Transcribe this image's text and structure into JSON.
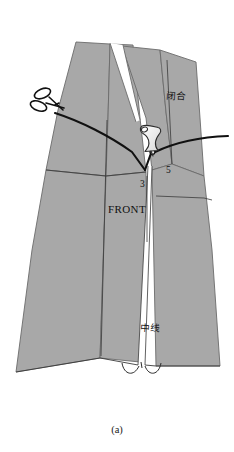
{
  "figure": {
    "caption": "(a)",
    "kind": "garment-pattern-diagram",
    "background_color": "#ffffff",
    "panel_fill": "#a8a8a8",
    "panel_stroke": "#6b6b6b",
    "line_color": "#111111"
  },
  "labels": {
    "front": "FRONT",
    "notch_left_number": "3",
    "notch_right_number": "5",
    "closure_cjk": "闭合",
    "centerline_cjk": "中线"
  },
  "icons": {
    "scissors": "scissors-icon",
    "pushpin": "pushpin-icon"
  }
}
